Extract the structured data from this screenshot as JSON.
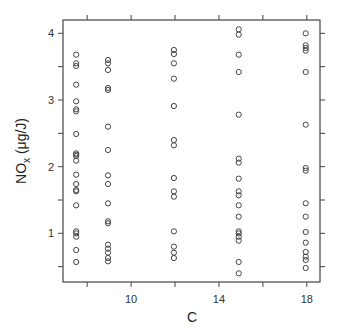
{
  "chart_data": {
    "type": "scatter",
    "title": "",
    "xlabel": "C",
    "ylabel": "NO",
    "ylabel_sub": "x",
    "ylabel_units": " (μg/J)",
    "xlim": [
      6.9,
      18.6
    ],
    "ylim": [
      0.27,
      4.2
    ],
    "xticks": [
      8,
      10,
      12,
      14,
      16,
      18
    ],
    "xtick_labels": [
      "",
      "10",
      "",
      "14",
      "",
      "18"
    ],
    "yticks": [
      0.5,
      1,
      1.5,
      2,
      2.5,
      3,
      3.5,
      4
    ],
    "ytick_labels": [
      "",
      "1",
      "",
      "2",
      "",
      "3",
      "",
      "4"
    ],
    "grid": false,
    "marker": "open-circle",
    "series": [
      {
        "name": "observations",
        "points": [
          {
            "x": 7.5,
            "y": [
              3.68,
              3.55,
              3.51,
              3.23,
              2.98,
              2.86,
              2.83,
              2.49,
              2.2,
              2.18,
              2.16,
              2.09,
              1.88,
              1.74,
              1.65,
              1.63,
              1.42,
              1.03,
              1.0,
              0.95,
              0.75,
              0.57
            ]
          },
          {
            "x": 8.95,
            "y": [
              3.6,
              3.55,
              3.45,
              3.18,
              3.15,
              2.6,
              2.25,
              1.87,
              1.74,
              1.45,
              1.18,
              1.15,
              0.83,
              0.77,
              0.71,
              0.63,
              0.58
            ]
          },
          {
            "x": 11.95,
            "y": [
              3.75,
              3.69,
              3.55,
              3.32,
              2.91,
              2.4,
              2.32,
              1.83,
              1.63,
              1.55,
              1.03,
              0.8,
              0.71,
              0.63
            ]
          },
          {
            "x": 14.9,
            "y": [
              4.06,
              3.98,
              3.68,
              3.42,
              2.78,
              2.12,
              2.06,
              1.82,
              1.63,
              1.57,
              1.42,
              1.25,
              1.03,
              1.0,
              0.95,
              0.89,
              0.57,
              0.4
            ]
          },
          {
            "x": 17.95,
            "y": [
              4.0,
              3.82,
              3.78,
              3.74,
              3.42,
              2.63,
              1.98,
              1.94,
              1.45,
              1.25,
              1.02,
              0.86,
              0.72,
              0.65,
              0.6,
              0.48
            ]
          }
        ]
      }
    ]
  }
}
